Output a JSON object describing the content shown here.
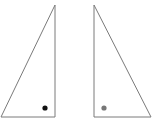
{
  "figure": {
    "background_color": "#ffffff",
    "stroke_color": "#7a7a7a",
    "triangles": [
      {
        "name": "left-triangle",
        "right_angle_corner": "bottom-right",
        "dot_color": "#111111"
      },
      {
        "name": "right-triangle",
        "right_angle_corner": "bottom-left",
        "dot_color": "#777777"
      }
    ]
  }
}
